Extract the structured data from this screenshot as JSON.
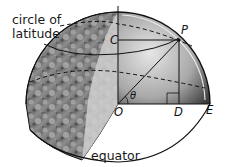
{
  "labels": {
    "circle_of_latitude_line1": "circle of",
    "circle_of_latitude_line2": "latitude",
    "equator": "equator"
  },
  "points": {
    "C": "C",
    "P": "P",
    "O": "O",
    "D": "D",
    "E": "E",
    "theta": "θ"
  },
  "colors": {
    "background": "#ffffff",
    "line": "#111111",
    "globe_shadow": "#3a3a3a",
    "globe_highlight": "#d8d8d8"
  }
}
